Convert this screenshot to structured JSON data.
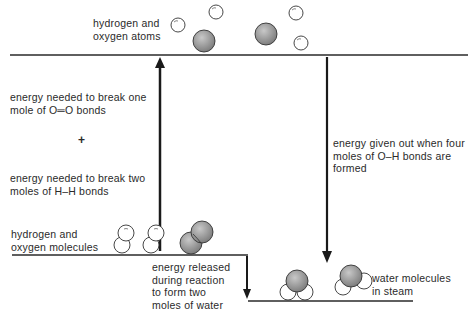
{
  "levels": {
    "top": {
      "label": "hydrogen and\noxygen atoms"
    },
    "middle": {
      "label": "hydrogen and\noxygen molecules"
    },
    "bottom": {
      "label": "water molecules\nin steam"
    }
  },
  "annotations": {
    "break_oo": "energy needed to break one\nmole of O═O bonds",
    "plus": "+",
    "break_hh": "energy needed to break two\nmoles of H–H bonds",
    "form_oh": "energy given out when four\nmoles of O–H bonds are\nformed",
    "released": "energy released\nduring reaction\nto form two\nmoles of water"
  },
  "colors": {
    "line": "#2a2a2a",
    "oxygen_fill": "#9a9a9a",
    "hydrogen_fill": "#ffffff"
  }
}
